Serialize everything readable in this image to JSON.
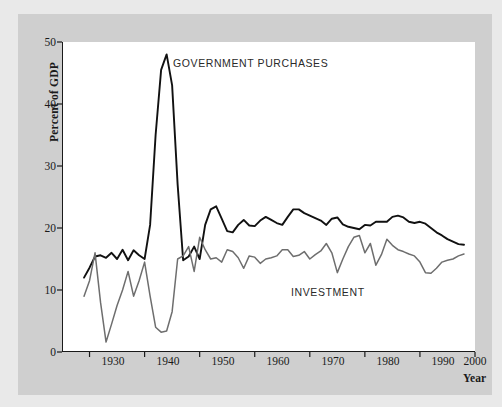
{
  "chart_data": {
    "type": "line",
    "title": "",
    "xlabel": "Year",
    "ylabel": "Percent of GDP",
    "xlim": [
      1925,
      2000
    ],
    "ylim": [
      0,
      50
    ],
    "xticks": [
      1930,
      1940,
      1950,
      1960,
      1970,
      1980,
      1990,
      2000
    ],
    "yticks": [
      0,
      10,
      20,
      30,
      40,
      50
    ],
    "grid": false,
    "legend_position": "inline-annotations",
    "annotations": [
      {
        "text": "GOVERNMENT PURCHASES",
        "near_year": 1947,
        "near_value": 45
      },
      {
        "text": "INVESTMENT",
        "near_year": 1970,
        "near_value": 9
      }
    ],
    "x": [
      1929,
      1930,
      1931,
      1932,
      1933,
      1934,
      1935,
      1936,
      1937,
      1938,
      1939,
      1940,
      1941,
      1942,
      1943,
      1944,
      1945,
      1946,
      1947,
      1948,
      1949,
      1950,
      1951,
      1952,
      1953,
      1954,
      1955,
      1956,
      1957,
      1958,
      1959,
      1960,
      1961,
      1962,
      1963,
      1964,
      1965,
      1966,
      1967,
      1968,
      1969,
      1970,
      1971,
      1972,
      1973,
      1974,
      1975,
      1976,
      1977,
      1978,
      1979,
      1980,
      1981,
      1982,
      1983,
      1984,
      1985,
      1986,
      1987,
      1988,
      1989,
      1990,
      1991,
      1992,
      1993,
      1994,
      1995,
      1996,
      1997,
      1998
    ],
    "series": [
      {
        "name": "GOVERNMENT PURCHASES",
        "color": "#111111",
        "width": 1.9,
        "values": [
          12.0,
          13.6,
          15.4,
          15.6,
          15.2,
          16.0,
          15.0,
          16.5,
          14.8,
          16.4,
          15.6,
          15.0,
          20.5,
          35.0,
          45.5,
          48.0,
          43.0,
          27.0,
          14.8,
          15.4,
          17.0,
          15.0,
          20.5,
          23.0,
          23.5,
          21.5,
          19.5,
          19.3,
          20.5,
          21.3,
          20.4,
          20.3,
          21.2,
          21.8,
          21.3,
          20.8,
          20.5,
          21.8,
          23.0,
          23.0,
          22.4,
          22.0,
          21.6,
          21.2,
          20.5,
          21.5,
          21.7,
          20.6,
          20.2,
          20.0,
          19.8,
          20.5,
          20.4,
          21.0,
          21.0,
          21.0,
          21.8,
          22.0,
          21.7,
          21.0,
          20.8,
          21.0,
          20.7,
          20.0,
          19.3,
          18.8,
          18.2,
          17.8,
          17.4,
          17.3
        ]
      },
      {
        "name": "INVESTMENT",
        "color": "#6e6e6e",
        "width": 1.5,
        "values": [
          9.0,
          11.5,
          16.0,
          8.0,
          1.6,
          4.5,
          7.5,
          10.0,
          13.0,
          9.0,
          11.5,
          14.5,
          9.0,
          4.0,
          3.2,
          3.4,
          6.5,
          15.0,
          15.5,
          17.0,
          13.0,
          18.5,
          16.5,
          15.0,
          15.2,
          14.5,
          16.5,
          16.2,
          15.2,
          13.5,
          15.5,
          15.3,
          14.3,
          15.0,
          15.2,
          15.5,
          16.5,
          16.5,
          15.4,
          15.6,
          16.2,
          15.0,
          15.7,
          16.3,
          17.5,
          16.0,
          12.8,
          15.0,
          17.0,
          18.5,
          18.8,
          16.0,
          17.5,
          14.0,
          15.7,
          18.2,
          17.2,
          16.5,
          16.2,
          15.8,
          15.5,
          14.5,
          12.8,
          12.7,
          13.5,
          14.5,
          14.8,
          15.0,
          15.5,
          15.8
        ]
      }
    ]
  },
  "axes": {
    "ylabel": "Percent of GDP",
    "xlabel": "Year",
    "ytick_labels": [
      "0",
      "10",
      "20",
      "30",
      "40",
      "50"
    ],
    "xtick_labels": [
      "1930",
      "1940",
      "1950",
      "1960",
      "1970",
      "1980",
      "1990",
      "2000"
    ]
  },
  "labels": {
    "government": "GOVERNMENT PURCHASES",
    "investment": "INVESTMENT"
  },
  "colors": {
    "page_background": "#e9e9e9",
    "panel_background": "#cfcfcf",
    "plot_background": "#ffffff",
    "axis": "#1a1a1a",
    "government_line": "#111111",
    "investment_line": "#6e6e6e",
    "text": "#1a1a1a"
  }
}
